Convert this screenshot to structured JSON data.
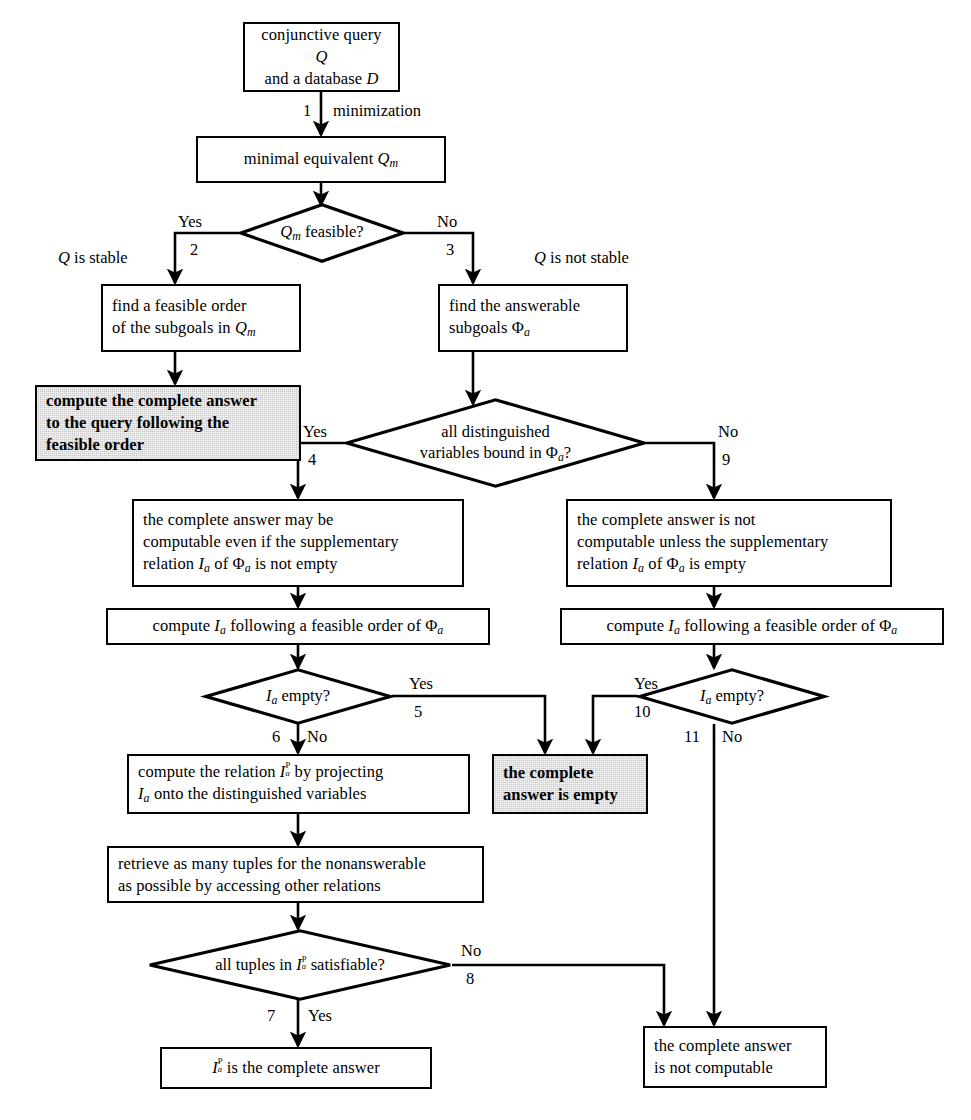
{
  "diagram": {
    "type": "flowchart",
    "caption": "",
    "colors": {
      "line": "#000000",
      "node_fill": "#ffffff",
      "shaded_fill": "#c9c9c9",
      "text": "#000000"
    },
    "nodes": [
      {
        "id": "start",
        "shape": "box",
        "shaded": false,
        "lines": [
          "conjunctive query Q",
          "and a database D"
        ]
      },
      {
        "id": "minimal",
        "shape": "box",
        "shaded": false,
        "lines": [
          "minimal equivalent Qm"
        ]
      },
      {
        "id": "feasible_q",
        "shape": "diamond",
        "shaded": false,
        "lines": [
          "Qm feasible?"
        ]
      },
      {
        "id": "find_order",
        "shape": "box",
        "shaded": false,
        "lines": [
          "find a feasible order",
          "of the subgoals in Qm"
        ]
      },
      {
        "id": "compute_full",
        "shape": "box",
        "shaded": true,
        "lines": [
          "compute the complete answer",
          "to the query following the",
          "feasible order"
        ]
      },
      {
        "id": "find_answerable",
        "shape": "box",
        "shaded": false,
        "lines": [
          "find the answerable",
          "subgoals Φa"
        ]
      },
      {
        "id": "bound_q",
        "shape": "diamond",
        "shaded": false,
        "lines": [
          "all distinguished",
          "variables bound in Φa?"
        ]
      },
      {
        "id": "may_be",
        "shape": "box",
        "shaded": false,
        "lines": [
          "the complete answer may be",
          "computable even if the supplementary",
          "relation Ia of Φa is not empty"
        ]
      },
      {
        "id": "not_unless",
        "shape": "box",
        "shaded": false,
        "lines": [
          "the complete answer is not",
          "computable unless the supplementary",
          "relation Ia of Φa is empty"
        ]
      },
      {
        "id": "compute_ia_l",
        "shape": "box",
        "shaded": false,
        "lines": [
          "compute Ia following a feasible order of Φa"
        ]
      },
      {
        "id": "compute_ia_r",
        "shape": "box",
        "shaded": false,
        "lines": [
          "compute Ia following a feasible order of Φa"
        ]
      },
      {
        "id": "ia_empty_l",
        "shape": "diamond",
        "shaded": false,
        "lines": [
          "Ia empty?"
        ]
      },
      {
        "id": "ia_empty_r",
        "shape": "diamond",
        "shaded": false,
        "lines": [
          "Ia empty?"
        ]
      },
      {
        "id": "answer_empty",
        "shape": "box",
        "shaded": true,
        "lines": [
          "the complete",
          "answer is empty"
        ]
      },
      {
        "id": "project",
        "shape": "box",
        "shaded": false,
        "lines": [
          "compute the relation IaP by projecting",
          "Ia onto the distinguished variables"
        ]
      },
      {
        "id": "retrieve",
        "shape": "box",
        "shaded": false,
        "lines": [
          "retrieve as many tuples for the nonanswerable",
          "as possible by accessing other relations"
        ]
      },
      {
        "id": "satisfiable_q",
        "shape": "diamond",
        "shaded": false,
        "lines": [
          "all tuples in IaP satisfiable?"
        ]
      },
      {
        "id": "iap_answer",
        "shape": "box",
        "shaded": true,
        "lines": [
          "IaP is the complete answer"
        ]
      },
      {
        "id": "not_computable",
        "shape": "box",
        "shaded": true,
        "lines": [
          "the complete answer",
          "is not computable"
        ]
      }
    ],
    "edge_labels": {
      "e1_num": "1",
      "e1_text": "minimization",
      "e2_yes": "Yes",
      "e2_num": "2",
      "e2_text": "Q is stable",
      "e3_no": "No",
      "e3_num": "3",
      "e3_text": "Q is not stable",
      "e4_yes": "Yes",
      "e4_num": "4",
      "e9_no": "No",
      "e9_num": "9",
      "e5_yes": "Yes",
      "e5_num": "5",
      "e6_no": "No",
      "e6_num": "6",
      "e10_yes": "Yes",
      "e10_num": "10",
      "e11_no": "No",
      "e11_num": "11",
      "e7_yes": "Yes",
      "e7_num": "7",
      "e8_no": "No",
      "e8_num": "8"
    }
  }
}
